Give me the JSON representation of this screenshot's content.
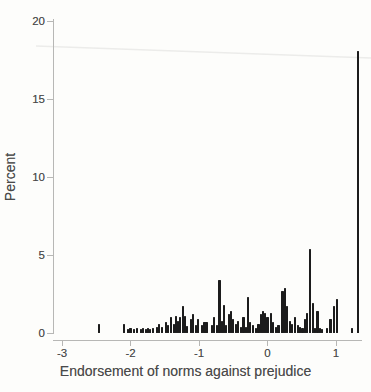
{
  "figure": {
    "background_color": "#fdfdfb",
    "bar_color": "#1c1c1c",
    "axis_color": "#b7b7b5",
    "text_color": "#4a4a4a",
    "scan_artifact_line_color": "#ececea"
  },
  "chart_data": {
    "type": "bar",
    "subtype": "histogram",
    "title": "",
    "xlabel": "Endorsement of norms against prejudice",
    "ylabel": "Percent",
    "xlim": [
      -3.13,
      1.4
    ],
    "ylim": [
      0,
      20
    ],
    "x_ticks": [
      -3,
      -2,
      -1,
      0,
      1
    ],
    "x_tick_labels": [
      "-3",
      "-2",
      "-1",
      "0",
      "1"
    ],
    "y_ticks": [
      0,
      5,
      10,
      15,
      20
    ],
    "y_tick_labels": [
      "0",
      "5",
      "10",
      "15",
      "20"
    ],
    "grid": false,
    "legend": "none",
    "bars_unit": "percent",
    "bars": [
      [
        -2.46,
        0.55
      ],
      [
        -2.09,
        0.6
      ],
      [
        -2.04,
        0.25
      ],
      [
        -2.0,
        0.3
      ],
      [
        -1.95,
        0.25
      ],
      [
        -1.91,
        0.3
      ],
      [
        -1.85,
        0.25
      ],
      [
        -1.82,
        0.3
      ],
      [
        -1.77,
        0.25
      ],
      [
        -1.74,
        0.3
      ],
      [
        -1.71,
        0.25
      ],
      [
        -1.67,
        0.3
      ],
      [
        -1.61,
        0.4
      ],
      [
        -1.58,
        0.55
      ],
      [
        -1.54,
        0.4
      ],
      [
        -1.48,
        0.7
      ],
      [
        -1.45,
        0.5
      ],
      [
        -1.41,
        1.0
      ],
      [
        -1.37,
        0.6
      ],
      [
        -1.34,
        1.1
      ],
      [
        -1.31,
        0.8
      ],
      [
        -1.28,
        1.0
      ],
      [
        -1.23,
        1.7
      ],
      [
        -1.2,
        1.1
      ],
      [
        -1.17,
        0.45
      ],
      [
        -1.12,
        0.9
      ],
      [
        -1.09,
        1.2
      ],
      [
        -1.04,
        0.5
      ],
      [
        -1.01,
        0.9
      ],
      [
        -0.96,
        0.5
      ],
      [
        -0.92,
        0.7
      ],
      [
        -0.89,
        0.7
      ],
      [
        -0.81,
        0.5
      ],
      [
        -0.78,
        1.0
      ],
      [
        -0.74,
        0.5
      ],
      [
        -0.7,
        3.4
      ],
      [
        -0.67,
        0.8
      ],
      [
        -0.64,
        1.8
      ],
      [
        -0.6,
        0.5
      ],
      [
        -0.56,
        1.2
      ],
      [
        -0.53,
        1.4
      ],
      [
        -0.5,
        0.9
      ],
      [
        -0.46,
        0.6
      ],
      [
        -0.43,
        0.8
      ],
      [
        -0.39,
        0.4
      ],
      [
        -0.35,
        1.0
      ],
      [
        -0.31,
        0.4
      ],
      [
        -0.28,
        2.3
      ],
      [
        -0.25,
        0.7
      ],
      [
        -0.21,
        0.5
      ],
      [
        -0.17,
        0.3
      ],
      [
        -0.13,
        0.6
      ],
      [
        -0.1,
        1.2
      ],
      [
        -0.07,
        1.4
      ],
      [
        -0.04,
        1.3
      ],
      [
        0.0,
        1.0
      ],
      [
        0.05,
        1.3
      ],
      [
        0.08,
        0.7
      ],
      [
        0.12,
        0.4
      ],
      [
        0.16,
        0.5
      ],
      [
        0.22,
        2.7
      ],
      [
        0.26,
        2.9
      ],
      [
        0.29,
        1.7
      ],
      [
        0.33,
        0.8
      ],
      [
        0.36,
        0.6
      ],
      [
        0.4,
        1.0
      ],
      [
        0.44,
        0.5
      ],
      [
        0.47,
        0.4
      ],
      [
        0.51,
        0.3
      ],
      [
        0.55,
        0.9
      ],
      [
        0.58,
        1.3
      ],
      [
        0.62,
        5.4
      ],
      [
        0.66,
        1.9
      ],
      [
        0.69,
        0.3
      ],
      [
        0.73,
        1.4
      ],
      [
        0.77,
        0.3
      ],
      [
        0.8,
        0.25
      ],
      [
        0.87,
        0.3
      ],
      [
        0.92,
        0.9
      ],
      [
        0.97,
        1.7
      ],
      [
        1.01,
        2.2
      ],
      [
        1.23,
        0.3
      ],
      [
        1.32,
        18.1
      ]
    ]
  }
}
